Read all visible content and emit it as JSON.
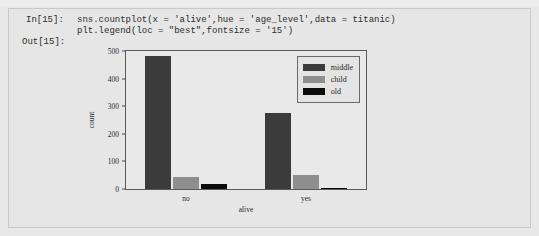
{
  "top_sliver": {
    "ghost_text": "·· ·· · ·· ·······"
  },
  "cell": {
    "in_prompt": "In[15]:",
    "out_prompt": "Out[15]:",
    "code_lines": [
      "sns.countplot(x = 'alive',hue = 'age_level',data = titanic)",
      "plt.legend(loc = \"best\",fontsize = '15')"
    ]
  },
  "chart_data": {
    "type": "bar",
    "title": "",
    "xlabel": "alive",
    "ylabel": "count",
    "categories": [
      "no",
      "yes"
    ],
    "series": [
      {
        "name": "middle",
        "values": [
          483,
          274
        ],
        "color": "#3b3b3b"
      },
      {
        "name": "child",
        "values": [
          44,
          50
        ],
        "color": "#8e8e8e"
      },
      {
        "name": "old",
        "values": [
          17,
          4
        ],
        "color": "#0b0b0b"
      }
    ],
    "ylim": [
      0,
      500
    ],
    "yticks": [
      0,
      100,
      200,
      300,
      400,
      500
    ],
    "ytick_labels": [
      "0",
      "100",
      "200",
      "300",
      "400",
      "500"
    ],
    "grid": false,
    "legend_position": "upper right",
    "legend_entries": [
      "middle",
      "child",
      "old"
    ]
  }
}
